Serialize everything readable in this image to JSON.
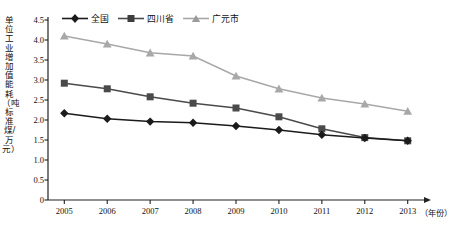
{
  "chart_data": {
    "type": "line",
    "title": "",
    "xlabel": "（年份）",
    "ylabel": "单位工业增加值能耗（吨标准煤/万元）",
    "categories": [
      "2005",
      "2006",
      "2007",
      "2008",
      "2009",
      "2010",
      "2011",
      "2012",
      "2013"
    ],
    "x": [
      2005,
      2006,
      2007,
      2008,
      2009,
      2010,
      2011,
      2012,
      2013
    ],
    "xlim": [
      2004.6,
      2013.6
    ],
    "ylim": [
      0,
      4.5
    ],
    "yticks": [
      "0",
      "0.5",
      "1.0",
      "1.5",
      "2.0",
      "2.5",
      "3.0",
      "3.5",
      "4.0",
      "4.5"
    ],
    "ytick_values": [
      0,
      0.5,
      1.0,
      1.5,
      2.0,
      2.5,
      3.0,
      3.5,
      4.0,
      4.5
    ],
    "grid": false,
    "legend_position": "top-center",
    "series": [
      {
        "name": "全国",
        "marker": "diamond",
        "color": "#1b1b1b",
        "values": [
          2.17,
          2.03,
          1.96,
          1.93,
          1.85,
          1.75,
          1.63,
          1.55,
          1.48
        ]
      },
      {
        "name": "四川省",
        "marker": "square",
        "color": "#4a4a4a",
        "values": [
          2.92,
          2.78,
          2.58,
          2.42,
          2.3,
          2.08,
          1.78,
          1.56,
          1.48
        ]
      },
      {
        "name": "广元市",
        "marker": "triangle",
        "color": "#a8a8a8",
        "values": [
          4.1,
          3.9,
          3.68,
          3.6,
          3.1,
          2.78,
          2.55,
          2.4,
          2.22
        ]
      }
    ]
  },
  "axis": {
    "y_title": "单位工业增加值能耗（吨标准煤/万元）",
    "x_title": "（年份）"
  },
  "legend": {
    "items": [
      {
        "label": "全国",
        "marker": "diamond-marker-icon",
        "color": "#1b1b1b"
      },
      {
        "label": "四川省",
        "marker": "square-marker-icon",
        "color": "#4a4a4a"
      },
      {
        "label": "广元市",
        "marker": "triangle-marker-icon",
        "color": "#a8a8a8"
      }
    ]
  }
}
